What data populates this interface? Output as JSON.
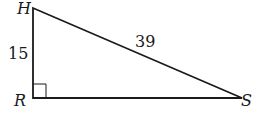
{
  "diagram": {
    "type": "right-triangle",
    "vertices": {
      "H": {
        "label": "H",
        "x": 33,
        "y": 8
      },
      "R": {
        "label": "R",
        "x": 33,
        "y": 98
      },
      "S": {
        "label": "S",
        "x": 242,
        "y": 98
      }
    },
    "sides": {
      "HR": {
        "label": "15"
      },
      "HS": {
        "label": "39"
      }
    },
    "right_angle_at": "R",
    "stroke_color": "#1a1a1a"
  }
}
